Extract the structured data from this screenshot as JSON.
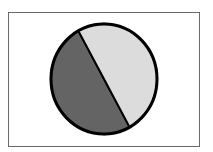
{
  "chart_data": {
    "type": "pie",
    "title": "",
    "categories": [
      "Dark slice",
      "Light slice"
    ],
    "values": [
      50,
      50
    ],
    "colors": [
      "#646464",
      "#dcdcdc"
    ],
    "outline_color": "#000000",
    "legend": "none",
    "labels": []
  }
}
